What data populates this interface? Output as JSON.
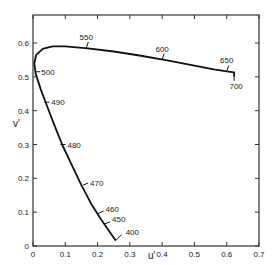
{
  "chart_data": {
    "type": "line",
    "title": "",
    "xlabel": "u'",
    "ylabel": "v'",
    "xlim": [
      0,
      0.7
    ],
    "ylim": [
      0,
      0.65
    ],
    "xticks": [
      "0",
      "0.1",
      "0.2",
      "0.3",
      "0.4",
      "0.5",
      "0.6",
      "0.7"
    ],
    "yticks": [
      "0",
      "0.1",
      "0.2",
      "0.3",
      "0.4",
      "0.5",
      "0.6"
    ],
    "grid": false,
    "legend": null,
    "series": [
      {
        "name": "spectrum locus",
        "points": [
          {
            "u": 0.256,
            "v": 0.016
          },
          {
            "u": 0.235,
            "v": 0.045
          },
          {
            "u": 0.21,
            "v": 0.08
          },
          {
            "u": 0.18,
            "v": 0.125
          },
          {
            "u": 0.15,
            "v": 0.18
          },
          {
            "u": 0.12,
            "v": 0.24
          },
          {
            "u": 0.09,
            "v": 0.3
          },
          {
            "u": 0.065,
            "v": 0.36
          },
          {
            "u": 0.045,
            "v": 0.41
          },
          {
            "u": 0.025,
            "v": 0.46
          },
          {
            "u": 0.008,
            "v": 0.51
          },
          {
            "u": 0.004,
            "v": 0.54
          },
          {
            "u": 0.01,
            "v": 0.565
          },
          {
            "u": 0.03,
            "v": 0.583
          },
          {
            "u": 0.06,
            "v": 0.59
          },
          {
            "u": 0.1,
            "v": 0.59
          },
          {
            "u": 0.17,
            "v": 0.584
          },
          {
            "u": 0.25,
            "v": 0.575
          },
          {
            "u": 0.33,
            "v": 0.563
          },
          {
            "u": 0.42,
            "v": 0.548
          },
          {
            "u": 0.5,
            "v": 0.533
          },
          {
            "u": 0.56,
            "v": 0.522
          },
          {
            "u": 0.6,
            "v": 0.516
          },
          {
            "u": 0.623,
            "v": 0.513
          },
          {
            "u": 0.623,
            "v": 0.5
          }
        ]
      }
    ],
    "annotations": [
      {
        "label": "550",
        "u": 0.165,
        "v": 0.585
      },
      {
        "label": "600",
        "u": 0.4,
        "v": 0.551
      },
      {
        "label": "650",
        "u": 0.6,
        "v": 0.516
      },
      {
        "label": "700",
        "u": 0.623,
        "v": 0.5
      },
      {
        "label": "500",
        "u": 0.007,
        "v": 0.515
      },
      {
        "label": "490",
        "u": 0.035,
        "v": 0.425
      },
      {
        "label": "480",
        "u": 0.085,
        "v": 0.3
      },
      {
        "label": "470",
        "u": 0.155,
        "v": 0.18
      },
      {
        "label": "460",
        "u": 0.2,
        "v": 0.095
      },
      {
        "label": "450",
        "u": 0.22,
        "v": 0.065
      },
      {
        "label": "400",
        "u": 0.256,
        "v": 0.016
      }
    ]
  }
}
